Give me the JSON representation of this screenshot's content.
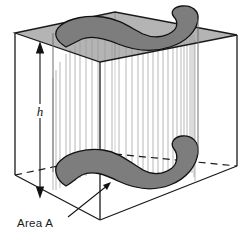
{
  "figure": {
    "labels": {
      "height": "h",
      "area": "Area A"
    },
    "colors": {
      "outline": "#1a1a1a",
      "top_face_fill": "#b4b4b4",
      "cross_section_fill": "#7d7d7d",
      "lateral_line": "#9a9a9a",
      "background": "#ffffff",
      "hidden_edge": "#1a1a1a"
    },
    "elements": {
      "bounding_box": "rectangular-prism-wireframe",
      "top_face": "shaded-top-parallelogram",
      "top_cross_section": "blob-cross-section-top",
      "bottom_cross_section": "blob-cross-section-bottom",
      "lateral_surface": "vertical-ruled-lines",
      "hidden_back_edge": "dashed-line",
      "height_dimension": "double-headed-vertical-arrow",
      "area_leader": "leader-line-to-bottom-blob"
    },
    "geometry": {
      "top_face_corners": [
        [
          15,
          33
        ],
        [
          115,
          12
        ],
        [
          237,
          35
        ],
        [
          100,
          62
        ]
      ],
      "bottom_face_corners": [
        [
          15,
          175
        ],
        [
          115,
          154
        ],
        [
          237,
          166
        ],
        [
          100,
          220
        ]
      ],
      "height_arrow_x": 40,
      "height_arrow_top_y": 44,
      "height_arrow_bottom_y": 196,
      "area_label_position": [
        18,
        226
      ],
      "leader_line": [
        [
          68,
          216
        ],
        [
          108,
          186
        ]
      ]
    }
  }
}
